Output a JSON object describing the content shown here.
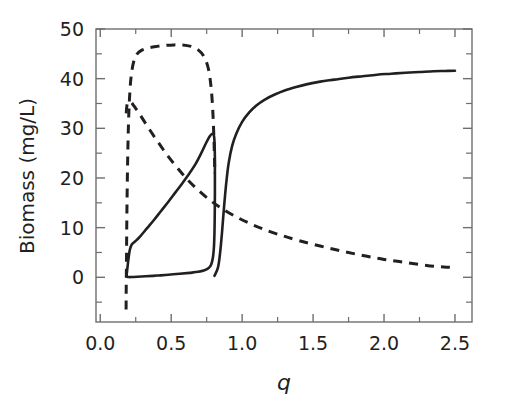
{
  "chart_data": {
    "type": "line",
    "title": "",
    "xlabel": "q",
    "ylabel": "Biomass (mg/L)",
    "xlim": [
      -0.03,
      2.62
    ],
    "ylim": [
      -9,
      50
    ],
    "grid": false,
    "legend": null,
    "x_ticks_major": [
      "0.0",
      "0.5",
      "1.0",
      "1.5",
      "2.0",
      "2.5"
    ],
    "x_tick_values": [
      0.0,
      0.5,
      1.0,
      1.5,
      2.0,
      2.5
    ],
    "x_ticks_minor": [
      0.25,
      0.75,
      1.25,
      1.75,
      2.25
    ],
    "y_ticks_major": [
      "0",
      "10",
      "20",
      "30",
      "40",
      "50"
    ],
    "y_tick_values": [
      0,
      10,
      20,
      30,
      40,
      50
    ],
    "y_ticks_minor": [
      5,
      15,
      25,
      35,
      45
    ],
    "series": [
      {
        "name": "stable-upper-branch",
        "style": "solid",
        "points": [
          [
            0.805,
            0.3
          ],
          [
            0.83,
            2.0
          ],
          [
            0.845,
            5.0
          ],
          [
            0.858,
            9.0
          ],
          [
            0.872,
            14.0
          ],
          [
            0.888,
            19.0
          ],
          [
            0.905,
            23.0
          ],
          [
            0.93,
            26.5
          ],
          [
            0.96,
            29.0
          ],
          [
            1.0,
            31.3
          ],
          [
            1.05,
            33.2
          ],
          [
            1.1,
            34.6
          ],
          [
            1.16,
            35.8
          ],
          [
            1.23,
            36.8
          ],
          [
            1.3,
            37.6
          ],
          [
            1.38,
            38.3
          ],
          [
            1.46,
            38.9
          ],
          [
            1.55,
            39.4
          ],
          [
            1.65,
            39.8
          ],
          [
            1.75,
            40.2
          ],
          [
            1.85,
            40.5
          ],
          [
            1.95,
            40.8
          ],
          [
            2.05,
            41.0
          ],
          [
            2.15,
            41.2
          ],
          [
            2.25,
            41.35
          ],
          [
            2.35,
            41.5
          ],
          [
            2.43,
            41.55
          ],
          [
            2.5,
            41.6
          ]
        ]
      },
      {
        "name": "cycle-minimum-branch",
        "style": "solid",
        "points": [
          [
            0.185,
            0.25
          ],
          [
            0.19,
            0.1
          ],
          [
            0.2,
            0.05
          ],
          [
            0.22,
            0.05
          ],
          [
            0.26,
            0.1
          ],
          [
            0.32,
            0.2
          ],
          [
            0.4,
            0.35
          ],
          [
            0.48,
            0.5
          ],
          [
            0.56,
            0.7
          ],
          [
            0.63,
            0.9
          ],
          [
            0.69,
            1.1
          ],
          [
            0.73,
            1.35
          ],
          [
            0.762,
            1.8
          ],
          [
            0.782,
            2.6
          ],
          [
            0.794,
            4.0
          ],
          [
            0.801,
            6.0
          ],
          [
            0.805,
            9.0
          ],
          [
            0.807,
            13.0
          ],
          [
            0.808,
            17.0
          ],
          [
            0.808,
            21.0
          ]
        ]
      },
      {
        "name": "cycle-maximum-branch",
        "style": "solid",
        "points": [
          [
            0.185,
            0.3
          ],
          [
            0.19,
            1.5
          ],
          [
            0.198,
            3.5
          ],
          [
            0.208,
            5.5
          ],
          [
            0.222,
            6.6
          ],
          [
            0.245,
            7.2
          ],
          [
            0.28,
            8.2
          ],
          [
            0.33,
            9.9
          ],
          [
            0.38,
            11.6
          ],
          [
            0.43,
            13.4
          ],
          [
            0.48,
            15.2
          ],
          [
            0.53,
            17.1
          ],
          [
            0.58,
            19.0
          ],
          [
            0.63,
            21.0
          ],
          [
            0.675,
            23.0
          ],
          [
            0.715,
            25.2
          ],
          [
            0.745,
            27.0
          ],
          [
            0.772,
            28.4
          ],
          [
            0.79,
            28.9
          ],
          [
            0.802,
            28.4
          ],
          [
            0.806,
            26.5
          ],
          [
            0.808,
            24.0
          ],
          [
            0.808,
            21.0
          ]
        ]
      },
      {
        "name": "unstable-upper-branch",
        "style": "dashed",
        "points": [
          [
            0.182,
            -6.5
          ],
          [
            0.183,
            -2.0
          ],
          [
            0.185,
            4.0
          ],
          [
            0.187,
            11.0
          ],
          [
            0.19,
            18.0
          ],
          [
            0.194,
            25.0
          ],
          [
            0.199,
            31.0
          ],
          [
            0.206,
            36.0
          ],
          [
            0.216,
            40.0
          ],
          [
            0.232,
            43.0
          ],
          [
            0.255,
            44.8
          ],
          [
            0.29,
            45.7
          ],
          [
            0.34,
            46.2
          ],
          [
            0.4,
            46.5
          ],
          [
            0.46,
            46.7
          ],
          [
            0.52,
            46.8
          ],
          [
            0.58,
            46.8
          ],
          [
            0.64,
            46.5
          ],
          [
            0.69,
            45.8
          ],
          [
            0.73,
            44.5
          ],
          [
            0.762,
            42.0
          ],
          [
            0.782,
            38.0
          ],
          [
            0.794,
            33.0
          ],
          [
            0.801,
            28.0
          ],
          [
            0.805,
            24.0
          ],
          [
            0.807,
            21.5
          ]
        ]
      },
      {
        "name": "unstable-lower-branch",
        "style": "dashed",
        "points": [
          [
            0.183,
            33.0
          ],
          [
            0.188,
            34.6
          ],
          [
            0.197,
            35.3
          ],
          [
            0.21,
            35.4
          ],
          [
            0.222,
            35.1
          ],
          [
            0.24,
            34.4
          ],
          [
            0.27,
            33.2
          ],
          [
            0.31,
            31.4
          ],
          [
            0.36,
            29.2
          ],
          [
            0.42,
            26.7
          ],
          [
            0.48,
            24.3
          ],
          [
            0.55,
            21.8
          ],
          [
            0.62,
            19.5
          ],
          [
            0.7,
            17.3
          ],
          [
            0.78,
            15.4
          ],
          [
            0.86,
            13.8
          ],
          [
            0.95,
            12.3
          ],
          [
            1.05,
            10.9
          ],
          [
            1.15,
            9.7
          ],
          [
            1.27,
            8.5
          ],
          [
            1.4,
            7.4
          ],
          [
            1.55,
            6.3
          ],
          [
            1.7,
            5.3
          ],
          [
            1.85,
            4.4
          ],
          [
            2.0,
            3.6
          ],
          [
            2.15,
            3.0
          ],
          [
            2.3,
            2.4
          ],
          [
            2.42,
            2.1
          ],
          [
            2.5,
            2.0
          ]
        ]
      }
    ]
  }
}
